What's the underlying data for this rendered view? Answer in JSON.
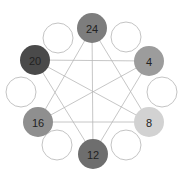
{
  "diagram": {
    "type": "circular-graph",
    "colors": {
      "edge": "#b8b8b8",
      "empty_stroke": "#c4c4c4",
      "label": "#222222"
    },
    "nodes": [
      {
        "id": "n24",
        "label": "24",
        "cx": 92,
        "cy": 28,
        "r": 15,
        "fill": "#7d7d7d"
      },
      {
        "id": "n4",
        "label": "4",
        "cx": 149,
        "cy": 61,
        "r": 15,
        "fill": "#9c9c9c"
      },
      {
        "id": "n8",
        "label": "8",
        "cx": 149,
        "cy": 122,
        "r": 15,
        "fill": "#d2d2d2"
      },
      {
        "id": "n12",
        "label": "12",
        "cx": 93,
        "cy": 154,
        "r": 15,
        "fill": "#6e6e6e"
      },
      {
        "id": "n16",
        "label": "16",
        "cx": 38,
        "cy": 122,
        "r": 15,
        "fill": "#8f8f8f"
      },
      {
        "id": "n20",
        "label": "20",
        "cx": 35,
        "cy": 60,
        "r": 15,
        "fill": "#4a4a4a"
      }
    ],
    "empty_nodes": [
      {
        "cx": 58,
        "cy": 38,
        "r": 15
      },
      {
        "cx": 126,
        "cy": 37,
        "r": 15
      },
      {
        "cx": 21,
        "cy": 92,
        "r": 15
      },
      {
        "cx": 162,
        "cy": 92,
        "r": 15
      },
      {
        "cx": 57,
        "cy": 145,
        "r": 15
      },
      {
        "cx": 126,
        "cy": 145,
        "r": 15
      }
    ],
    "edges": [
      [
        "n24",
        "n12"
      ],
      [
        "n24",
        "n16"
      ],
      [
        "n24",
        "n8"
      ],
      [
        "n20",
        "n4"
      ],
      [
        "n20",
        "n8"
      ],
      [
        "n20",
        "n12"
      ],
      [
        "n4",
        "n16"
      ],
      [
        "n4",
        "n12"
      ],
      [
        "n16",
        "n8"
      ]
    ]
  }
}
